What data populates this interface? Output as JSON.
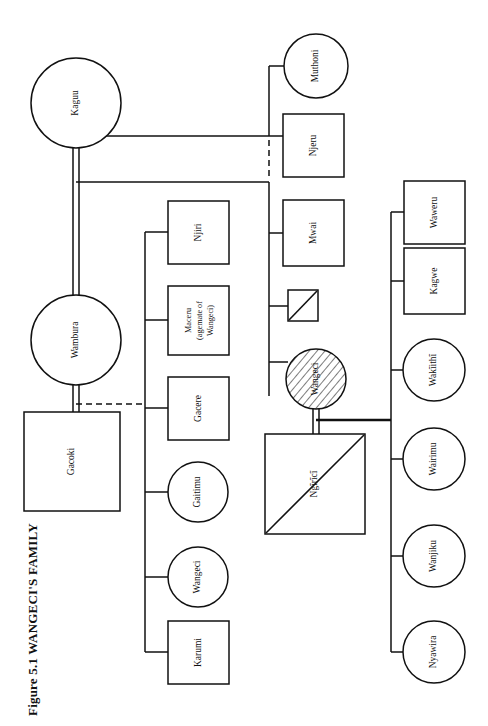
{
  "figure": {
    "title": "Figure 5.1  WANGECI'S FAMILY",
    "caption_label": "Figure 5.1",
    "caption_subject": "WANGECI'S FAMILY",
    "orientation": "rotated-90-ccw",
    "page_width": 488,
    "page_height": 726,
    "ink_color": "#111111",
    "background_color": "#ffffff"
  },
  "legend_semantics": {
    "circle": "female",
    "square": "male",
    "diagonal_slash": "deceased",
    "hatched_fill": "ego / focal person",
    "double_line": "marriage",
    "dashed_line": "attenuated or inferred link",
    "single_line": "descent / sibling link"
  },
  "generations": {
    "g1": {
      "label": "grandparental generation",
      "members": [
        "Kaguu",
        "Wambura"
      ]
    },
    "g2": {
      "label": "parental generation",
      "members": [
        "Muthoni",
        "Njeru",
        "Mwai",
        "Wangeci",
        "Njiri",
        "Maceru",
        "Gacere",
        "Gaitimu",
        "Karumi",
        "Gacoki",
        "Ngirici"
      ]
    },
    "g3": {
      "label": "children of Wangeci and Ngirici",
      "members": [
        "Waweru",
        "Kagwe",
        "Wakiithi",
        "Wairimu",
        "Wanjiku",
        "Nyawira"
      ]
    }
  },
  "nodes": [
    {
      "id": "kaguu",
      "name": "Kaguu",
      "shape": "circle",
      "sex": "female",
      "deceased": false,
      "ego": false,
      "cx": 76,
      "cy": 103,
      "r": 45
    },
    {
      "id": "wambura",
      "name": "Wambura",
      "shape": "circle",
      "sex": "female",
      "deceased": false,
      "ego": false,
      "cx": 76,
      "cy": 340,
      "r": 45
    },
    {
      "id": "muthoni",
      "name": "Muthoni",
      "shape": "circle",
      "sex": "female",
      "deceased": false,
      "ego": false,
      "cx": 316,
      "cy": 66,
      "r": 32
    },
    {
      "id": "njeru",
      "name": "Njeru",
      "shape": "square",
      "sex": "male",
      "deceased": false,
      "ego": false,
      "x": 283,
      "y": 114,
      "w": 61,
      "h": 63
    },
    {
      "id": "mwai",
      "name": "Mwai",
      "shape": "square",
      "sex": "male",
      "deceased": false,
      "ego": false,
      "x": 283,
      "y": 200,
      "w": 61,
      "h": 66
    },
    {
      "id": "unnamed-deceased",
      "name": "",
      "shape": "square",
      "sex": "male",
      "deceased": true,
      "ego": false,
      "x": 288,
      "y": 290,
      "w": 30,
      "h": 31
    },
    {
      "id": "wangeci-ego",
      "name": "Wangeci",
      "shape": "circle",
      "sex": "female",
      "deceased": false,
      "ego": true,
      "cx": 316,
      "cy": 379,
      "r": 30
    },
    {
      "id": "ngiriciimport",
      "name": "Ngĩrĩcĩ",
      "shape": "square",
      "sex": "male",
      "deceased": true,
      "ego": false,
      "x": 265,
      "y": 434,
      "w": 100,
      "h": 100
    },
    {
      "id": "njiri",
      "name": "Njiri",
      "shape": "square",
      "sex": "male",
      "deceased": false,
      "ego": false,
      "x": 168,
      "y": 201,
      "w": 61,
      "h": 63
    },
    {
      "id": "maceru",
      "name": "Maceru (agemate of Wangeci)",
      "name_lines": [
        "Maceru",
        "(agemate of",
        "Wangeci)"
      ],
      "shape": "square",
      "sex": "male",
      "deceased": false,
      "ego": false,
      "x": 168,
      "y": 286,
      "w": 61,
      "h": 69
    },
    {
      "id": "gacere",
      "name": "Gacere",
      "shape": "square",
      "sex": "male",
      "deceased": false,
      "ego": false,
      "x": 168,
      "y": 377,
      "w": 61,
      "h": 63
    },
    {
      "id": "gaitimu",
      "name": "Gaitimu",
      "shape": "circle",
      "sex": "female",
      "deceased": false,
      "ego": false,
      "cx": 198,
      "cy": 492,
      "r": 30
    },
    {
      "id": "wangeci-sibling",
      "name": "Wangeci",
      "shape": "circle",
      "sex": "female",
      "deceased": false,
      "ego": false,
      "cx": 198,
      "cy": 577,
      "r": 30
    },
    {
      "id": "karumi",
      "name": "Karumi",
      "shape": "square",
      "sex": "male",
      "deceased": false,
      "ego": false,
      "x": 168,
      "y": 621,
      "w": 61,
      "h": 63
    },
    {
      "id": "gacoki",
      "name": "Gacoki",
      "shape": "square",
      "sex": "male",
      "deceased": false,
      "ego": false,
      "x": 24,
      "y": 412,
      "w": 96,
      "h": 99
    },
    {
      "id": "waweru",
      "name": "Waweru",
      "shape": "square",
      "sex": "male",
      "deceased": false,
      "ego": false,
      "x": 404,
      "y": 181,
      "w": 61,
      "h": 63
    },
    {
      "id": "kagwe",
      "name": "Kagwe",
      "shape": "square",
      "sex": "male",
      "deceased": false,
      "ego": false,
      "x": 404,
      "y": 248,
      "w": 61,
      "h": 66
    },
    {
      "id": "wakiithi",
      "name": "Wakĩithĩ",
      "shape": "circle",
      "sex": "female",
      "deceased": false,
      "ego": false,
      "cx": 434,
      "cy": 370,
      "r": 31
    },
    {
      "id": "wairimu",
      "name": "Wairimu",
      "shape": "circle",
      "sex": "female",
      "deceased": false,
      "ego": false,
      "cx": 434,
      "cy": 459,
      "r": 31
    },
    {
      "id": "wanjiku",
      "name": "Wanjiku",
      "shape": "circle",
      "sex": "female",
      "deceased": false,
      "ego": false,
      "cx": 434,
      "cy": 556,
      "r": 31
    },
    {
      "id": "nyawira",
      "name": "Nyawira",
      "shape": "circle",
      "sex": "female",
      "deceased": false,
      "ego": false,
      "cx": 434,
      "cy": 652,
      "r": 31
    }
  ],
  "marriages": [
    {
      "id": "kaguu-wambura",
      "spouses": [
        "Kaguu",
        "Wambura"
      ],
      "style": "double"
    },
    {
      "id": "wangeci-ngiriciimport",
      "spouses": [
        "Wangeci",
        "Ngĩrĩcĩ"
      ],
      "style": "double"
    }
  ],
  "links": [
    {
      "id": "kaguu-to-children-bar",
      "from": "Kaguu",
      "to": "children of Kaguu",
      "style": "single"
    },
    {
      "id": "wambura-to-children-bar",
      "from": "Wambura",
      "to": "children of Wambura",
      "style": "single"
    },
    {
      "id": "gacoki-dashed",
      "from": "Gacoki",
      "to": "Wambura sibling bar",
      "style": "dashed"
    },
    {
      "id": "njeru-dashed",
      "from": "Njeru",
      "to": "Kaguu sibling bar",
      "style": "dashed"
    },
    {
      "id": "wangeci-ngiriciimport-children",
      "from": "Wangeci & Ngĩrĩcĩ",
      "to": "children bar",
      "style": "single"
    }
  ]
}
